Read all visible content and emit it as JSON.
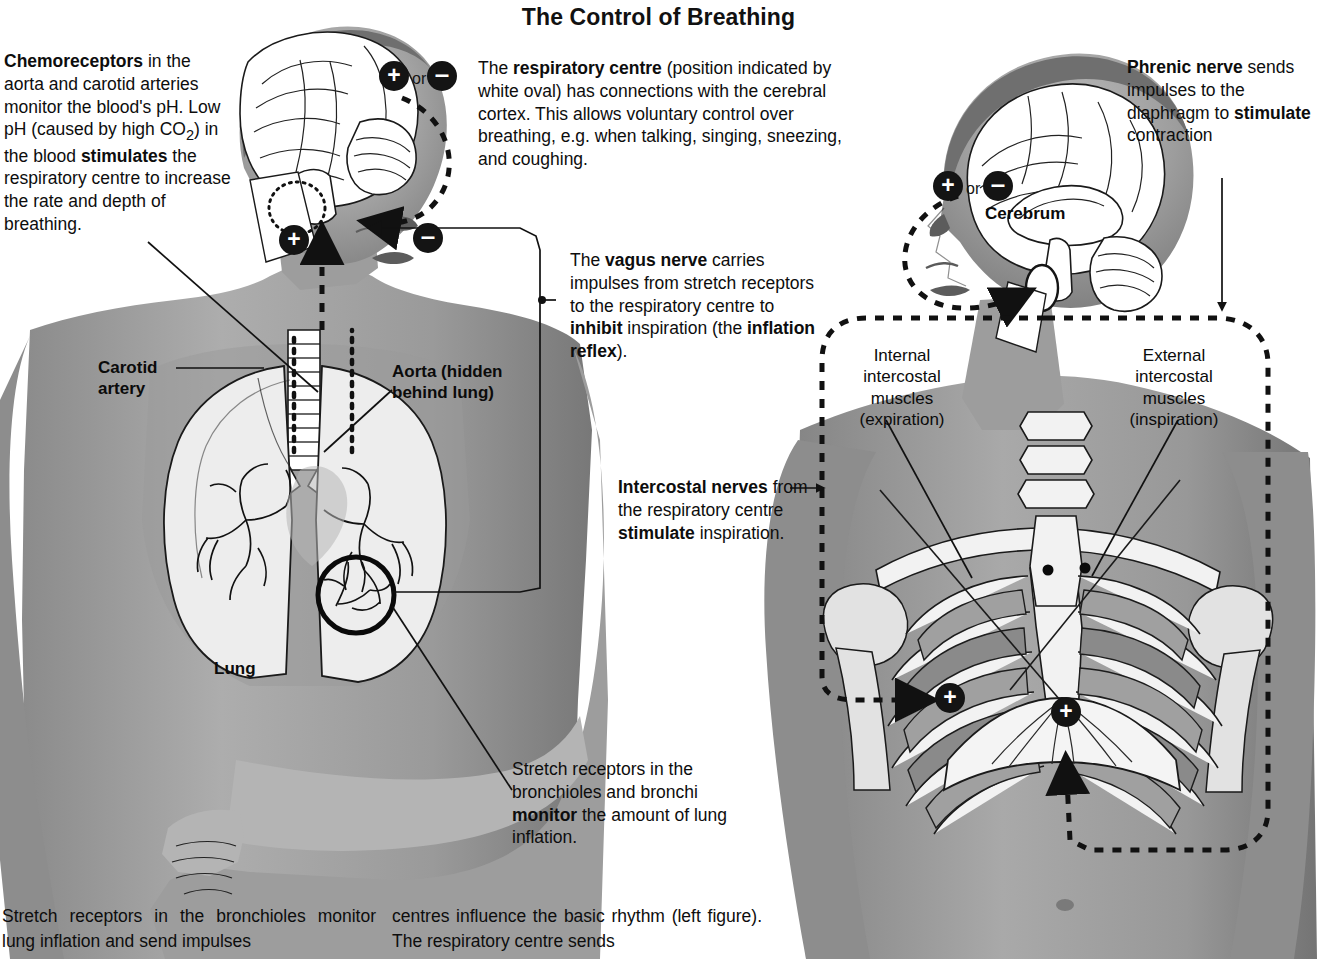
{
  "title": "The Control of Breathing",
  "figure_left": {
    "callouts": {
      "chemoreceptors": "Chemoreceptors in the aorta and carotid arteries monitor the blood's pH. Low pH (caused by high CO2) in the blood stimulates the respiratory centre to increase the rate and depth of breathing.",
      "respiratory_centre": "The respiratory centre (position indicated by white oval) has connections with the cerebral cortex. This allows voluntary control over breathing, e.g. when talking, singing, sneezing, and coughing.",
      "vagus_nerve": "The vagus nerve carries impulses from stretch receptors to the respiratory centre to inhibit inspiration (the inflation reflex).",
      "stretch_receptors": "Stretch receptors in the bronchioles and bronchi monitor the amount of lung inflation."
    },
    "labels": {
      "carotid_artery": "Carotid artery",
      "aorta": "Aorta (hidden behind lung)",
      "lung": "Lung"
    },
    "signs": {
      "plus": "+",
      "minus": "–",
      "or": "or"
    }
  },
  "figure_right": {
    "callouts": {
      "phrenic_nerve": "Phrenic nerve sends impulses to the diaphragm to stimulate contraction",
      "intercostal_nerves": "Intercostal nerves from the respiratory centre stimulate inspiration."
    },
    "labels": {
      "cerebrum": "Cerebrum",
      "internal_intercostal": "Internal intercostal muscles (expiration)",
      "external_intercostal": "External intercostal muscles (inspiration)"
    },
    "signs": {
      "plus": "+",
      "minus": "–",
      "or": "or"
    }
  },
  "caption": {
    "column_left": "Stretch receptors in the bronchioles monitor lung inflation and send impulses",
    "column_right": "centres influence the basic rhythm (left figure). The respiratory centre sends"
  },
  "colors": {
    "ink": "#111111",
    "badge": "#141414",
    "badge_text": "#ffffff",
    "paper": "#ffffff"
  }
}
